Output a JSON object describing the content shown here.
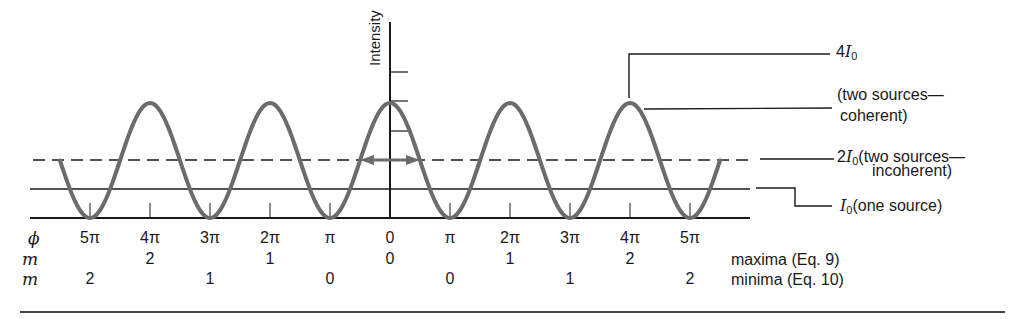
{
  "figure": {
    "y_axis_label": "Intensity",
    "row_labels": {
      "phi": "ϕ",
      "m_max": "m",
      "m_min": "m"
    },
    "phi_ticks": [
      {
        "label": "5π",
        "x": 90
      },
      {
        "label": "4π",
        "x": 150
      },
      {
        "label": "3π",
        "x": 210
      },
      {
        "label": "2π",
        "x": 270
      },
      {
        "label": "π",
        "x": 330
      },
      {
        "label": "0",
        "x": 390
      },
      {
        "label": "π",
        "x": 450
      },
      {
        "label": "2π",
        "x": 510
      },
      {
        "label": "3π",
        "x": 570
      },
      {
        "label": "4π",
        "x": 630
      },
      {
        "label": "5π",
        "x": 690
      }
    ],
    "maxima_m": [
      {
        "label": "2",
        "x": 150
      },
      {
        "label": "1",
        "x": 270
      },
      {
        "label": "0",
        "x": 390
      },
      {
        "label": "1",
        "x": 510
      },
      {
        "label": "2",
        "x": 630
      }
    ],
    "minima_m": [
      {
        "label": "2",
        "x": 90
      },
      {
        "label": "1",
        "x": 210
      },
      {
        "label": "0",
        "x": 330
      },
      {
        "label": "0",
        "x": 450
      },
      {
        "label": "1",
        "x": 570
      },
      {
        "label": "2",
        "x": 690
      }
    ],
    "row_captions": {
      "maxima": "maxima (Eq. 9)",
      "minima": "minima (Eq. 10)"
    },
    "annotations": {
      "four_i0": {
        "coef": "4",
        "sym": "I",
        "sub": "0"
      },
      "coherent_line1": "(two sources—",
      "coherent_line2": "coherent)",
      "two_i0": {
        "coef": "2",
        "sym": "I",
        "sub": "0",
        "text": "(two sources—"
      },
      "incoherent_line2": "incoherent)",
      "one_i0": {
        "sym": "I",
        "sub": "0",
        "text": "(one source)"
      }
    },
    "levels": {
      "I0": 1,
      "two_sources_incoherent": 2,
      "two_sources_coherent_max": 4
    },
    "colors": {
      "curve": "#6b6b6b",
      "lines": "#1a1a1a",
      "arrow": "#6b6b6b"
    }
  }
}
